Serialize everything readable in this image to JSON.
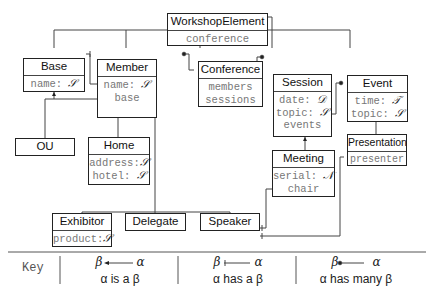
{
  "diagram": {
    "type": "class-diagram",
    "classes": [
      {
        "id": "WorkshopElement",
        "name": "WorkshopElement",
        "attributes": [
          {
            "name": "conference",
            "type": ""
          }
        ]
      },
      {
        "id": "Base",
        "name": "Base",
        "attributes": [
          {
            "name": "name:",
            "type": "S"
          }
        ]
      },
      {
        "id": "Member",
        "name": "Member",
        "attributes": [
          {
            "name": "name:",
            "type": "S"
          },
          {
            "name": "base",
            "type": ""
          }
        ]
      },
      {
        "id": "Conference",
        "name": "Conference",
        "attributes": [
          {
            "name": "members",
            "type": ""
          },
          {
            "name": "sessions",
            "type": ""
          }
        ]
      },
      {
        "id": "Session",
        "name": "Session",
        "attributes": [
          {
            "name": "date:",
            "type": "D"
          },
          {
            "name": "topic:",
            "type": "S"
          },
          {
            "name": "events",
            "type": ""
          }
        ]
      },
      {
        "id": "Event",
        "name": "Event",
        "attributes": [
          {
            "name": "time:",
            "type": "T"
          },
          {
            "name": "topic:",
            "type": "S"
          }
        ]
      },
      {
        "id": "OU",
        "name": "OU",
        "attributes": []
      },
      {
        "id": "Home",
        "name": "Home",
        "attributes": [
          {
            "name": "address:",
            "type": "S"
          },
          {
            "name": "hotel:",
            "type": "S"
          }
        ]
      },
      {
        "id": "Meeting",
        "name": "Meeting",
        "attributes": [
          {
            "name": "serial:",
            "type": "N"
          },
          {
            "name": "chair",
            "type": ""
          }
        ]
      },
      {
        "id": "Presentation",
        "name": "Presentation",
        "attributes": [
          {
            "name": "presenter",
            "type": ""
          }
        ]
      },
      {
        "id": "Exhibitor",
        "name": "Exhibitor",
        "attributes": [
          {
            "name": "product:",
            "type": "S"
          }
        ]
      },
      {
        "id": "Delegate",
        "name": "Delegate",
        "attributes": []
      },
      {
        "id": "Speaker",
        "name": "Speaker",
        "attributes": []
      }
    ],
    "relations": [
      {
        "from": "Base",
        "to": "WorkshopElement",
        "kind": "is-a"
      },
      {
        "from": "Member",
        "to": "WorkshopElement",
        "kind": "is-a"
      },
      {
        "from": "Conference",
        "to": "WorkshopElement",
        "kind": "is-a"
      },
      {
        "from": "Session",
        "to": "WorkshopElement",
        "kind": "is-a"
      },
      {
        "from": "Event",
        "to": "WorkshopElement",
        "kind": "is-a"
      },
      {
        "from": "OU",
        "to": "Base",
        "kind": "is-a"
      },
      {
        "from": "Home",
        "to": "Base",
        "kind": "is-a"
      },
      {
        "from": "Meeting",
        "to": "Session",
        "kind": "is-a"
      },
      {
        "from": "Presentation",
        "to": "Event",
        "kind": "is-a"
      },
      {
        "from": "Exhibitor",
        "to": "Member",
        "kind": "is-a"
      },
      {
        "from": "Delegate",
        "to": "Member",
        "kind": "is-a"
      },
      {
        "from": "Speaker",
        "to": "Member",
        "kind": "is-a"
      },
      {
        "from": "WorkshopElement.conference",
        "to": "Conference",
        "kind": "has-a"
      },
      {
        "from": "Member.base",
        "to": "Base",
        "kind": "has-a"
      },
      {
        "from": "Conference.members",
        "to": "Member",
        "kind": "has-many"
      },
      {
        "from": "Conference.sessions",
        "to": "Session",
        "kind": "has-many"
      },
      {
        "from": "Session.events",
        "to": "Event",
        "kind": "has-many"
      },
      {
        "from": "Meeting.chair",
        "to": "Speaker",
        "kind": "has-a"
      },
      {
        "from": "Presentation.presenter",
        "to": "Speaker",
        "kind": "has-a"
      }
    ]
  },
  "key": {
    "label": "Key",
    "items": [
      {
        "arrow_left": "β",
        "arrow_right": "α",
        "arrow_style": "arrowhead",
        "caption": "α is a β"
      },
      {
        "arrow_left": "β",
        "arrow_right": "α",
        "arrow_style": "bar",
        "caption": "α has a β"
      },
      {
        "arrow_left": "β",
        "arrow_right": "α",
        "arrow_style": "dot",
        "caption": "α has many β"
      }
    ]
  },
  "type_symbols": {
    "S": "𝒮",
    "D": "𝒟",
    "T": "𝒯",
    "N": "𝒩"
  }
}
